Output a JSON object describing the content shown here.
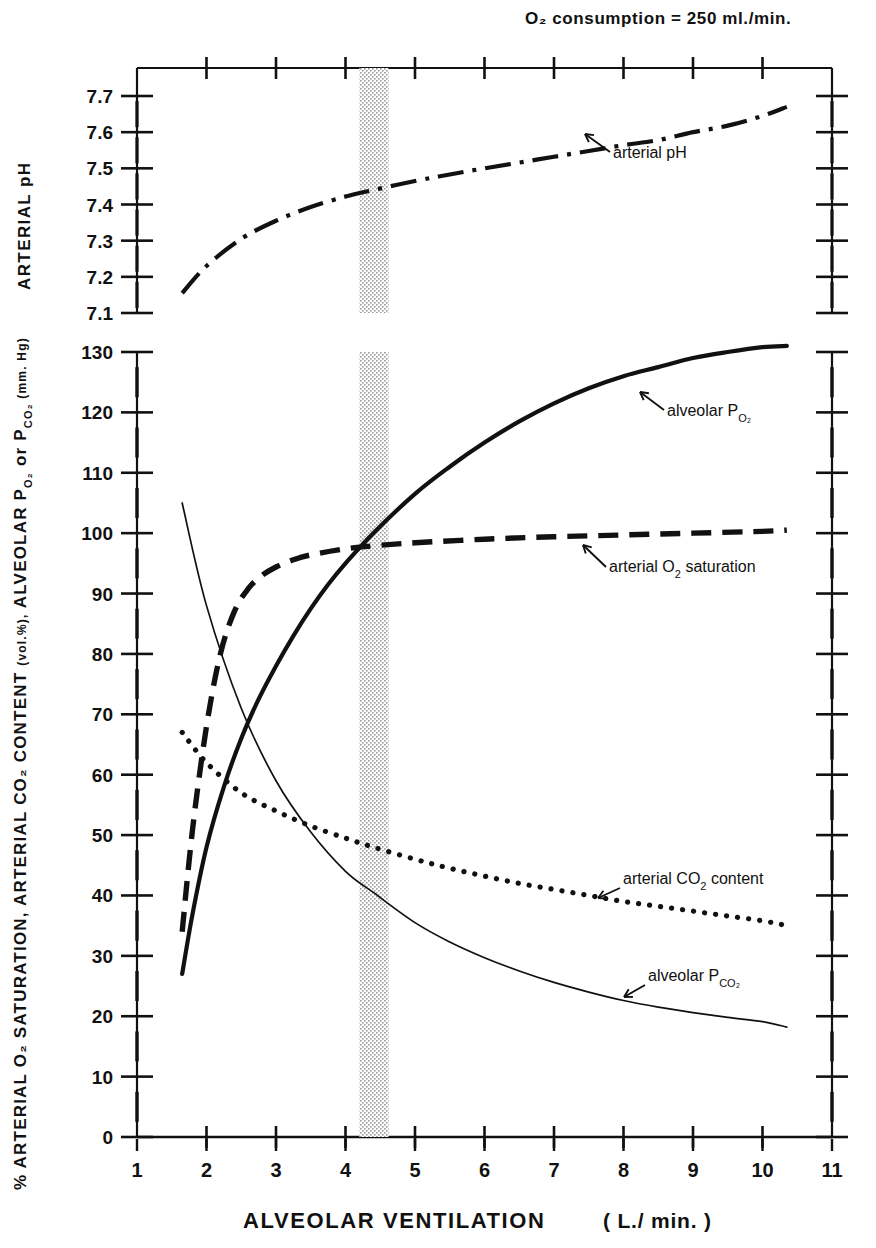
{
  "figure": {
    "header_note": "O₂ consumption = 250 ml./min.",
    "x_axis": {
      "label_main": "ALVEOLAR   VENTILATION",
      "label_units": "( L./ min. )",
      "ticks": [
        "1",
        "2",
        "3",
        "4",
        "5",
        "6",
        "7",
        "8",
        "9",
        "10",
        "11"
      ],
      "min": 1,
      "max": 11
    },
    "top_panel": {
      "axis_label": "ARTERIAL  pH",
      "ticks": [
        "7.7",
        "7.6",
        "7.5",
        "7.4",
        "7.3",
        "7.2",
        "7.1"
      ],
      "min": 7.1,
      "max": 7.7
    },
    "main_panel": {
      "axis_label_part1": "% ARTERIAL  O₂  SATURATION,  ARTERIAL  CO₂  CONTENT",
      "axis_label_part2": "(vol.%),",
      "axis_label_part3": "ALVEOLAR",
      "axis_label_part4": "P",
      "axis_label_part4_sub": "O₂",
      "axis_label_part5": "or",
      "axis_label_part6": "P",
      "axis_label_part6_sub": "CO₂",
      "axis_label_part7": "(mm. Hg)",
      "ticks": [
        "130",
        "120",
        "110",
        "100",
        "90",
        "80",
        "70",
        "60",
        "50",
        "40",
        "30",
        "20",
        "10",
        "0"
      ],
      "min": 0,
      "max": 130
    },
    "annotations": {
      "arterial_ph": "arterial  pH",
      "alveolar_po2_text": "alveolar",
      "alveolar_po2_sym": "P",
      "alveolar_po2_sub": "O₂",
      "arterial_o2_sat": "arterial  O₂  saturation",
      "arterial_co2_content": "arterial  CO₂  content",
      "alveolar_pco2_text": "alveolar",
      "alveolar_pco2_sym": "P",
      "alveolar_pco2_sub": "CO₂"
    },
    "shaded_band": {
      "name": "normal-resting-ventilation-band",
      "x_start": 4.2,
      "x_end": 4.62,
      "color": "#b9b9b9"
    },
    "colors": {
      "ink": "#111111",
      "paper": "#ffffff"
    }
  },
  "chart_data": {
    "type": "line",
    "xlabel": "ALVEOLAR VENTILATION ( L./min. )",
    "ylabel": "% ARTERIAL O₂ SATURATION, ARTERIAL CO₂ CONTENT (vol.%), ALVEOLAR P O₂ or P CO₂ (mm.Hg)",
    "xlim": [
      1,
      11
    ],
    "grid": false,
    "legend": "inline annotations",
    "panels": [
      {
        "name": "top-panel",
        "ylabel": "ARTERIAL pH",
        "ylim": [
          7.1,
          7.7
        ],
        "yticks": [
          7.1,
          7.2,
          7.3,
          7.4,
          7.5,
          7.6,
          7.7
        ],
        "series": [
          {
            "name": "arterial pH",
            "style": "dash-dot",
            "x": [
              1.65,
              2.0,
              2.5,
              3.0,
              3.5,
              4.0,
              4.4,
              5.0,
              5.5,
              6.0,
              6.5,
              7.0,
              7.5,
              8.0,
              8.5,
              9.0,
              9.5,
              10.0,
              10.35
            ],
            "y": [
              7.155,
              7.23,
              7.305,
              7.355,
              7.393,
              7.422,
              7.44,
              7.465,
              7.483,
              7.5,
              7.516,
              7.532,
              7.548,
              7.564,
              7.578,
              7.6,
              7.618,
              7.645,
              7.67
            ]
          }
        ]
      },
      {
        "name": "main-panel",
        "ylim": [
          0,
          130
        ],
        "yticks": [
          0,
          10,
          20,
          30,
          40,
          50,
          60,
          70,
          80,
          90,
          100,
          110,
          120,
          130
        ],
        "series": [
          {
            "name": "alveolar PO2",
            "style": "solid-thick",
            "units": "mm.Hg",
            "x": [
              1.65,
              1.8,
              2.0,
              2.25,
              2.5,
              2.75,
              3.0,
              3.25,
              3.5,
              3.75,
              4.0,
              4.4,
              5.0,
              5.5,
              6.0,
              6.5,
              7.0,
              7.5,
              8.0,
              8.5,
              9.0,
              9.5,
              10.0,
              10.35
            ],
            "y": [
              27,
              37,
              48,
              58,
              66,
              72.5,
              78,
              83,
              87.5,
              91.5,
              95,
              100,
              106.5,
              111,
              115,
              118.5,
              121.5,
              124,
              126,
              127.5,
              129,
              130,
              130.8,
              131
            ]
          },
          {
            "name": "arterial O2 saturation",
            "style": "dashed",
            "units": "vol.%",
            "x": [
              1.65,
              1.8,
              2.0,
              2.2,
              2.4,
              2.6,
              2.8,
              3.0,
              3.25,
              3.5,
              4.0,
              4.4,
              5.0,
              6.0,
              7.0,
              8.0,
              9.0,
              10.0,
              10.35
            ],
            "y": [
              34,
              51,
              68,
              80,
              87,
              90.8,
              93,
              94.4,
              95.6,
              96.4,
              97.4,
              97.9,
              98.4,
              99.0,
              99.4,
              99.7,
              100.0,
              100.3,
              100.5
            ]
          },
          {
            "name": "arterial CO2 content",
            "style": "dotted",
            "units": "vol.%",
            "x": [
              1.65,
              2.0,
              2.5,
              3.0,
              3.5,
              4.0,
              4.4,
              5.0,
              5.5,
              6.0,
              6.5,
              7.0,
              7.5,
              8.0,
              8.5,
              9.0,
              9.5,
              10.0,
              10.35
            ],
            "y": [
              67,
              62,
              57,
              54,
              51.5,
              49.5,
              48,
              46,
              44.5,
              43.2,
              42,
              41,
              40,
              39,
              38.2,
              37.4,
              36.6,
              35.8,
              35
            ]
          },
          {
            "name": "alveolar PCO2",
            "style": "solid-thin",
            "units": "mm.Hg",
            "x": [
              1.65,
              2.0,
              2.5,
              3.0,
              3.5,
              4.0,
              4.4,
              5.0,
              5.5,
              6.0,
              6.5,
              7.0,
              7.5,
              8.0,
              8.5,
              9.0,
              9.5,
              10.0,
              10.35
            ],
            "y": [
              105,
              88,
              71,
              59,
              50.5,
              44,
              40.5,
              35.5,
              32.3,
              29.7,
              27.5,
              25.6,
              24.0,
              22.6,
              21.5,
              20.6,
              19.8,
              19.1,
              18.2
            ]
          }
        ]
      }
    ],
    "annotations": [
      {
        "text": "arterial pH",
        "panel": "top-panel",
        "x": 6.4,
        "y": 7.56
      },
      {
        "text": "alveolar PO2",
        "panel": "main-panel",
        "x": 7.0,
        "y": 123
      },
      {
        "text": "arterial O2 saturation",
        "panel": "main-panel",
        "x": 6.6,
        "y": 93
      },
      {
        "text": "arterial CO2 content",
        "panel": "main-panel",
        "x": 7.6,
        "y": 43
      },
      {
        "text": "alveolar PCO2",
        "panel": "main-panel",
        "x": 7.9,
        "y": 24
      }
    ]
  }
}
